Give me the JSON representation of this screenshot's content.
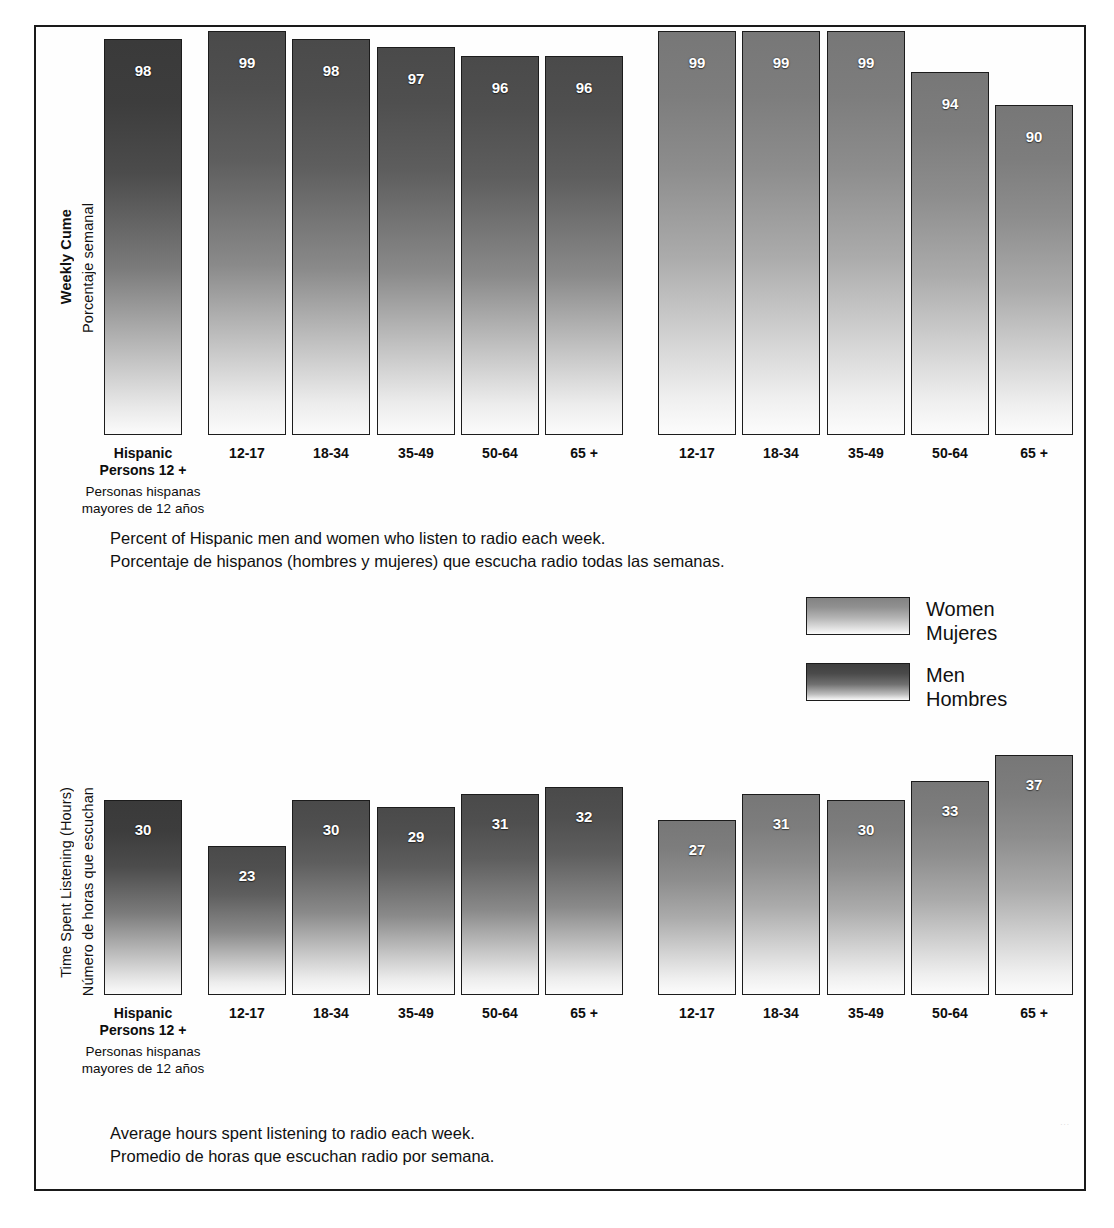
{
  "figure": {
    "border_color": "#1a1a1a",
    "background": "#ffffff"
  },
  "legend": {
    "position": "middle-right",
    "entries": [
      {
        "key": "women",
        "label_en": "Women",
        "label_es": "Mujeres",
        "color": "#8d8d8d"
      },
      {
        "key": "men",
        "label_en": "Men",
        "label_es": "Hombres",
        "color": "#4a4a4a"
      }
    ]
  },
  "panels": {
    "top": {
      "axis_title_en": "Weekly Cume",
      "axis_title_es": "Porcentaje semanal",
      "caption_en": "Percent of Hispanic men and women who listen to radio each week.",
      "caption_es": "Porcentaje de hispanos (hombres y mujeres) que escucha radio todas las semanas."
    },
    "bottom": {
      "axis_title_en": "Time Spent Listening (Hours)",
      "axis_title_es": "Número de horas que escuchan",
      "caption_en": "Average hours spent listening to radio each week.",
      "caption_es": "Promedio de horas que escuchan radio por semana."
    }
  },
  "total_label": {
    "line1": "Hispanic",
    "line2": "Persons 12 +",
    "sub1": "Personas hispanas",
    "sub2": "mayores de 12 años"
  },
  "chart_data": [
    {
      "id": "weekly-cume",
      "type": "bar",
      "title": "Weekly Cume / Porcentaje semanal",
      "subtitle": "Percent of Hispanic men and women who listen to radio each week.",
      "ylabel": "Weekly Cume (Porcentaje semanal)",
      "xlabel": "",
      "unit": "percent",
      "ylim": [
        0,
        100
      ],
      "grid": false,
      "legend_position": "middle-right",
      "categories": [
        "Hispanic Persons 12 +",
        "12-17",
        "18-34",
        "35-49",
        "50-64",
        "65 +",
        "12-17",
        "18-34",
        "35-49",
        "50-64",
        "65 +"
      ],
      "bars": [
        {
          "group": "Men",
          "category": "Hispanic Persons 12 +",
          "value": 98
        },
        {
          "group": "Men",
          "category": "12-17",
          "value": 99
        },
        {
          "group": "Men",
          "category": "18-34",
          "value": 98
        },
        {
          "group": "Men",
          "category": "35-49",
          "value": 97
        },
        {
          "group": "Men",
          "category": "50-64",
          "value": 96
        },
        {
          "group": "Men",
          "category": "65 +",
          "value": 96
        },
        {
          "group": "Women",
          "category": "12-17",
          "value": 99
        },
        {
          "group": "Women",
          "category": "18-34",
          "value": 99
        },
        {
          "group": "Women",
          "category": "35-49",
          "value": 99
        },
        {
          "group": "Women",
          "category": "50-64",
          "value": 94
        },
        {
          "group": "Women",
          "category": "65 +",
          "value": 90
        }
      ],
      "series": [
        {
          "name": "Men",
          "categories": [
            "Hispanic Persons 12 +",
            "12-17",
            "18-34",
            "35-49",
            "50-64",
            "65 +"
          ],
          "values": [
            98,
            99,
            98,
            97,
            96,
            96
          ]
        },
        {
          "name": "Women",
          "categories": [
            "12-17",
            "18-34",
            "35-49",
            "50-64",
            "65 +"
          ],
          "values": [
            99,
            99,
            99,
            94,
            90
          ]
        }
      ]
    },
    {
      "id": "time-spent-listening",
      "type": "bar",
      "title": "Time Spent Listening (Hours) / Número de horas que escuchan",
      "subtitle": "Average hours spent listening to radio each week.",
      "ylabel": "Time Spent Listening (Hours)",
      "xlabel": "",
      "unit": "hours",
      "ylim": [
        0,
        40
      ],
      "grid": false,
      "legend_position": "middle-right",
      "categories": [
        "Hispanic Persons 12 +",
        "12-17",
        "18-34",
        "35-49",
        "50-64",
        "65 +",
        "12-17",
        "18-34",
        "35-49",
        "50-64",
        "65 +"
      ],
      "bars": [
        {
          "group": "Men",
          "category": "Hispanic Persons 12 +",
          "value": 30
        },
        {
          "group": "Men",
          "category": "12-17",
          "value": 23
        },
        {
          "group": "Men",
          "category": "18-34",
          "value": 30
        },
        {
          "group": "Men",
          "category": "35-49",
          "value": 29
        },
        {
          "group": "Men",
          "category": "50-64",
          "value": 31
        },
        {
          "group": "Men",
          "category": "65 +",
          "value": 32
        },
        {
          "group": "Women",
          "category": "12-17",
          "value": 27
        },
        {
          "group": "Women",
          "category": "18-34",
          "value": 31
        },
        {
          "group": "Women",
          "category": "35-49",
          "value": 30
        },
        {
          "group": "Women",
          "category": "50-64",
          "value": 33
        },
        {
          "group": "Women",
          "category": "65 +",
          "value": 37
        }
      ],
      "series": [
        {
          "name": "Men",
          "categories": [
            "Hispanic Persons 12 +",
            "12-17",
            "18-34",
            "35-49",
            "50-64",
            "65 +"
          ],
          "values": [
            30,
            23,
            30,
            29,
            31,
            32
          ]
        },
        {
          "name": "Women",
          "categories": [
            "12-17",
            "18-34",
            "35-49",
            "50-64",
            "65 +"
          ],
          "values": [
            27,
            31,
            30,
            33,
            37
          ]
        }
      ]
    }
  ]
}
